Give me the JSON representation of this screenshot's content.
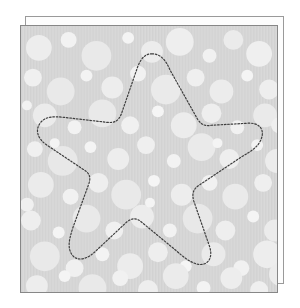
{
  "canvas": {
    "width": 300,
    "height": 308,
    "background": "#ffffff"
  },
  "document": {
    "title": "Star die-cut template",
    "description": "Dotted star cut-line on a dotted-circle patterned square sheet with an offset backing sheet"
  },
  "back_sheet": {
    "name": "backing-sheet",
    "x": 25,
    "y": 16,
    "width": 259,
    "height": 268,
    "fill": "#fdfdfd",
    "stroke": "#9a9a9a",
    "stroke_width": 1
  },
  "front_sheet": {
    "name": "patterned-sheet",
    "x": 20,
    "y": 25,
    "width": 258,
    "height": 268,
    "fill": "#d9d9d9",
    "stroke": "#878787",
    "stroke_width": 1,
    "pattern": {
      "type": "bokeh-circles-on-vertical-stripes",
      "base_color": "#d9d9d9",
      "stripe_color": "#d2d2d2",
      "stripe_period": 3,
      "circle_colors": [
        "#efefef",
        "#e8e8e8",
        "#e2e2e2",
        "#f6f6f6"
      ],
      "circles": [
        [
          18,
          22,
          13,
          "#ededed"
        ],
        [
          48,
          14,
          8,
          "#f2f2f2"
        ],
        [
          76,
          30,
          15,
          "#e9e9e9"
        ],
        [
          108,
          12,
          6,
          "#f4f4f4"
        ],
        [
          132,
          26,
          11,
          "#ececec"
        ],
        [
          160,
          16,
          14,
          "#eeeeee"
        ],
        [
          190,
          30,
          7,
          "#f1f1f1"
        ],
        [
          214,
          14,
          10,
          "#ebebeb"
        ],
        [
          240,
          28,
          13,
          "#efefef"
        ],
        [
          12,
          52,
          9,
          "#f0f0f0"
        ],
        [
          40,
          66,
          14,
          "#e9e9e9"
        ],
        [
          66,
          50,
          6,
          "#f3f3f3"
        ],
        [
          92,
          62,
          11,
          "#ededed"
        ],
        [
          118,
          48,
          8,
          "#f1f1f1"
        ],
        [
          146,
          64,
          15,
          "#eaeaea"
        ],
        [
          176,
          52,
          9,
          "#efefef"
        ],
        [
          202,
          66,
          12,
          "#ececec"
        ],
        [
          228,
          50,
          6,
          "#f4f4f4"
        ],
        [
          250,
          64,
          10,
          "#eeeeee"
        ],
        [
          24,
          90,
          12,
          "#ebebeb"
        ],
        [
          54,
          102,
          7,
          "#f2f2f2"
        ],
        [
          82,
          88,
          14,
          "#e9e9e9"
        ],
        [
          110,
          100,
          9,
          "#f0f0f0"
        ],
        [
          138,
          86,
          6,
          "#f5f5f5"
        ],
        [
          164,
          100,
          13,
          "#ececec"
        ],
        [
          192,
          88,
          10,
          "#eeeeee"
        ],
        [
          218,
          102,
          7,
          "#f1f1f1"
        ],
        [
          246,
          90,
          12,
          "#eaeaea"
        ],
        [
          14,
          124,
          8,
          "#f0f0f0"
        ],
        [
          42,
          136,
          15,
          "#e8e8e8"
        ],
        [
          70,
          122,
          6,
          "#f4f4f4"
        ],
        [
          98,
          134,
          11,
          "#ededed"
        ],
        [
          126,
          120,
          9,
          "#efefef"
        ],
        [
          154,
          136,
          7,
          "#f2f2f2"
        ],
        [
          182,
          122,
          14,
          "#eaeaea"
        ],
        [
          210,
          134,
          10,
          "#eeeeee"
        ],
        [
          238,
          120,
          6,
          "#f3f3f3"
        ],
        [
          258,
          136,
          12,
          "#ececec"
        ],
        [
          20,
          160,
          13,
          "#ebebeb"
        ],
        [
          50,
          172,
          8,
          "#f1f1f1"
        ],
        [
          78,
          158,
          10,
          "#eeeeee"
        ],
        [
          106,
          170,
          15,
          "#e9e9e9"
        ],
        [
          134,
          156,
          6,
          "#f5f5f5"
        ],
        [
          162,
          170,
          11,
          "#ededed"
        ],
        [
          190,
          158,
          8,
          "#f1f1f1"
        ],
        [
          216,
          172,
          13,
          "#eaeaea"
        ],
        [
          244,
          158,
          9,
          "#efefef"
        ],
        [
          10,
          196,
          10,
          "#eeeeee"
        ],
        [
          38,
          208,
          6,
          "#f4f4f4"
        ],
        [
          66,
          194,
          14,
          "#e9e9e9"
        ],
        [
          94,
          206,
          9,
          "#f0f0f0"
        ],
        [
          122,
          192,
          12,
          "#ececec"
        ],
        [
          150,
          206,
          7,
          "#f2f2f2"
        ],
        [
          178,
          194,
          15,
          "#e8e8e8"
        ],
        [
          206,
          206,
          10,
          "#eeeeee"
        ],
        [
          234,
          192,
          6,
          "#f4f4f4"
        ],
        [
          256,
          206,
          11,
          "#ebebeb"
        ],
        [
          24,
          232,
          15,
          "#e9e9e9"
        ],
        [
          54,
          244,
          9,
          "#f0f0f0"
        ],
        [
          82,
          230,
          7,
          "#f3f3f3"
        ],
        [
          110,
          242,
          13,
          "#ececec"
        ],
        [
          138,
          228,
          10,
          "#eeeeee"
        ],
        [
          166,
          242,
          6,
          "#f5f5f5"
        ],
        [
          194,
          230,
          12,
          "#eaeaea"
        ],
        [
          222,
          244,
          8,
          "#f1f1f1"
        ],
        [
          248,
          230,
          14,
          "#ededed"
        ],
        [
          16,
          262,
          11,
          "#ededed"
        ],
        [
          44,
          252,
          6,
          "#f4f4f4"
        ],
        [
          72,
          264,
          14,
          "#e9e9e9"
        ],
        [
          100,
          254,
          8,
          "#f1f1f1"
        ],
        [
          128,
          266,
          10,
          "#eeeeee"
        ],
        [
          156,
          252,
          13,
          "#ebebeb"
        ],
        [
          184,
          264,
          7,
          "#f3f3f3"
        ],
        [
          212,
          254,
          11,
          "#ededed"
        ],
        [
          240,
          266,
          9,
          "#efefef"
        ],
        [
          262,
          250,
          12,
          "#ebebeb"
        ],
        [
          6,
          80,
          5,
          "#f2f2f2"
        ],
        [
          6,
          180,
          7,
          "#f0f0f0"
        ],
        [
          260,
          100,
          8,
          "#efefef"
        ],
        [
          264,
          180,
          6,
          "#f2f2f2"
        ],
        [
          34,
          118,
          5,
          "#f4f4f4"
        ],
        [
          198,
          118,
          5,
          "#f4f4f4"
        ],
        [
          130,
          178,
          5,
          "#f4f4f4"
        ]
      ]
    }
  },
  "cut_line": {
    "name": "star-cut-path",
    "shape": "rounded-five-point-star",
    "stroke": "#3d3d3d",
    "stroke_width": 1.2,
    "dash": "1.6 1.8",
    "fill": "none",
    "points_outer": [
      {
        "label": "top",
        "x": 132,
        "y": 28
      },
      {
        "label": "right",
        "x": 238,
        "y": 103
      },
      {
        "label": "bottom-right",
        "x": 196,
        "y": 238
      },
      {
        "label": "bottom-left",
        "x": 64,
        "y": 241
      },
      {
        "label": "left",
        "x": 22,
        "y": 110
      }
    ],
    "points_inner": [
      {
        "label": "upper-right",
        "x": 192,
        "y": 98
      },
      {
        "label": "lower-right",
        "x": 176,
        "y": 186
      },
      {
        "label": "bottom",
        "x": 130,
        "y": 198
      },
      {
        "label": "lower-left",
        "x": 80,
        "y": 182
      },
      {
        "label": "upper-left",
        "x": 97,
        "y": 98
      }
    ],
    "path_d": "M 132 28 C 140 28 146 34 150 44 L 178 94 C 182 100 186 101 192 100 L 228 98 C 240 97 246 104 242 114 C 239 122 232 126 222 132 L 180 160 C 174 164 172 168 174 176 L 190 222 C 194 234 188 242 178 240 C 170 238 164 233 156 226 L 122 198 C 116 193 112 193 106 198 L 74 228 C 64 237 54 237 50 228 C 47 221 49 214 52 204 L 68 160 C 71 152 69 148 62 144 L 26 120 C 16 113 14 104 20 97 C 25 91 33 91 43 92 L 86 97 C 94 98 98 96 101 89 L 118 40 C 122 31 126 28 132 28 Z"
  }
}
